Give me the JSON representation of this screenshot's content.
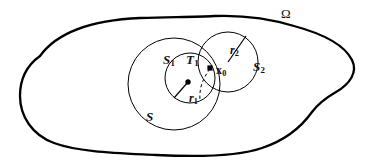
{
  "figure": {
    "kind": "mathematical-set-diagram",
    "width": 373,
    "height": 166,
    "background_color": "#ffffff",
    "stroke_color": "#000000",
    "labels": {
      "omega": "Ω",
      "outer_region_name": "omega-domain-boundary",
      "big_circle": "S",
      "inner_circle": "S",
      "inner_circle_subscript": "1",
      "right_circle": "S",
      "right_circle_subscript": "2",
      "tail_region": "T",
      "tail_region_subscript": "1",
      "point": "x",
      "point_subscript": "0",
      "radius_inner": "r",
      "radius_inner_subscript": "1",
      "radius_right": "r",
      "radius_right_subscript": "2"
    },
    "geometry": {
      "big_circle": {
        "cx": 174,
        "cy": 84,
        "r": 46
      },
      "inner_circle": {
        "cx": 190,
        "cy": 78,
        "r": 25
      },
      "right_circle": {
        "cx": 228,
        "cy": 62,
        "r": 30
      },
      "inner_center_dot": {
        "cx": 188,
        "cy": 82,
        "r": 2.6
      },
      "point_x0_marker": {
        "cx": 210,
        "cy": 68,
        "size": 5
      },
      "radius_inner_line": {
        "x1": 188,
        "y1": 82,
        "x2": 174,
        "y2": 98
      },
      "radius_right_line": {
        "x1": 228,
        "y1": 62,
        "x2": 246,
        "y2": 36
      }
    }
  }
}
